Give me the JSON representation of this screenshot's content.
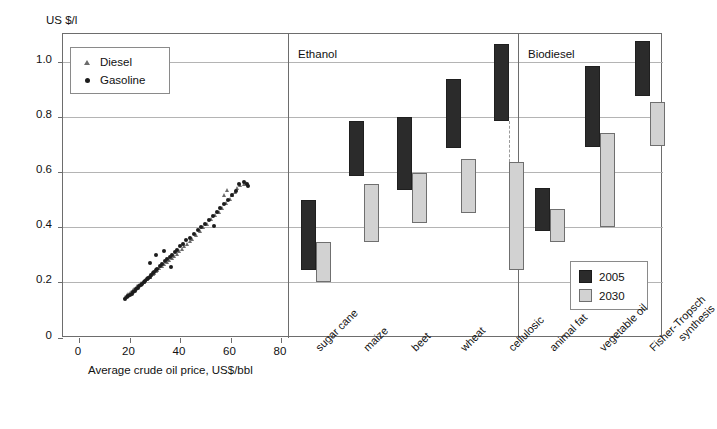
{
  "axes": {
    "y_axis_title": "US $/l",
    "y_ticks": [
      "0",
      "0.2",
      "0.4",
      "0.6",
      "0.8",
      "1.0"
    ],
    "x_axis_title_scatter": "Average crude oil price, US$/bbl",
    "x_ticks_scatter": [
      "0",
      "20",
      "40",
      "60",
      "80"
    ]
  },
  "legend_fuel": {
    "items": [
      {
        "label": "Diesel",
        "marker": "triangle-marker",
        "color": "#6b6b6b"
      },
      {
        "label": "Gasoline",
        "marker": "circle-marker",
        "color": "#1c1c1c"
      }
    ]
  },
  "legend_year": {
    "items": [
      {
        "label": "2005",
        "color": "#2b2b2b"
      },
      {
        "label": "2030",
        "color": "#d2d2d2"
      }
    ]
  },
  "panel_headers": [
    {
      "label": "Ethanol"
    },
    {
      "label": "Biodiesel"
    }
  ],
  "chart_data": [
    {
      "type": "scatter",
      "title": "",
      "xlabel": "Average crude oil price, US$/bbl",
      "ylabel": "US $/l",
      "xlim": [
        0,
        80
      ],
      "ylim": [
        0,
        1.1
      ],
      "grid": true,
      "legend_position": "top-left",
      "series": [
        {
          "name": "Diesel",
          "marker": "triangle",
          "color": "#6b6b6b",
          "points": [
            [
              18.6,
              0.145
            ],
            [
              19.2,
              0.15
            ],
            [
              19.8,
              0.155
            ],
            [
              20.4,
              0.158
            ],
            [
              21.0,
              0.163
            ],
            [
              21.6,
              0.168
            ],
            [
              22.2,
              0.172
            ],
            [
              22.8,
              0.178
            ],
            [
              23.4,
              0.182
            ],
            [
              24.0,
              0.188
            ],
            [
              24.6,
              0.193
            ],
            [
              25.2,
              0.196
            ],
            [
              25.8,
              0.2
            ],
            [
              26.4,
              0.205
            ],
            [
              27.0,
              0.21
            ],
            [
              27.6,
              0.213
            ],
            [
              28.2,
              0.218
            ],
            [
              28.8,
              0.222
            ],
            [
              29.4,
              0.228
            ],
            [
              30.0,
              0.232
            ],
            [
              30.6,
              0.238
            ],
            [
              31.2,
              0.243
            ],
            [
              32.0,
              0.248
            ],
            [
              33.0,
              0.255
            ],
            [
              34.0,
              0.262
            ],
            [
              35.0,
              0.27
            ],
            [
              36.0,
              0.278
            ],
            [
              37.0,
              0.285
            ],
            [
              38.0,
              0.292
            ],
            [
              39.0,
              0.3
            ],
            [
              40.0,
              0.31
            ],
            [
              41.0,
              0.318
            ],
            [
              42.0,
              0.328
            ],
            [
              43.0,
              0.336
            ],
            [
              44.0,
              0.345
            ],
            [
              45.0,
              0.353
            ],
            [
              46.5,
              0.368
            ],
            [
              48.0,
              0.382
            ],
            [
              49.5,
              0.398
            ],
            [
              51.0,
              0.41
            ],
            [
              52.5,
              0.425
            ],
            [
              54.0,
              0.44
            ],
            [
              55.5,
              0.452
            ],
            [
              57.0,
              0.468
            ],
            [
              58.5,
              0.485
            ],
            [
              60.0,
              0.5
            ],
            [
              61.0,
              0.512
            ],
            [
              62.0,
              0.525
            ],
            [
              63.0,
              0.54
            ],
            [
              64.0,
              0.548
            ],
            [
              65.5,
              0.553
            ],
            [
              66.5,
              0.558
            ],
            [
              59.0,
              0.532
            ],
            [
              57.5,
              0.515
            ]
          ]
        },
        {
          "name": "Gasoline",
          "marker": "circle",
          "color": "#1c1c1c",
          "points": [
            [
              18.4,
              0.14
            ],
            [
              19.0,
              0.146
            ],
            [
              19.6,
              0.15
            ],
            [
              20.2,
              0.154
            ],
            [
              20.8,
              0.159
            ],
            [
              21.4,
              0.164
            ],
            [
              22.0,
              0.17
            ],
            [
              22.6,
              0.175
            ],
            [
              23.2,
              0.18
            ],
            [
              23.8,
              0.186
            ],
            [
              24.4,
              0.19
            ],
            [
              25.0,
              0.195
            ],
            [
              25.6,
              0.2
            ],
            [
              26.2,
              0.206
            ],
            [
              26.8,
              0.212
            ],
            [
              27.4,
              0.216
            ],
            [
              28.0,
              0.22
            ],
            [
              28.6,
              0.226
            ],
            [
              29.2,
              0.232
            ],
            [
              29.8,
              0.238
            ],
            [
              30.4,
              0.244
            ],
            [
              31.0,
              0.25
            ],
            [
              32.0,
              0.26
            ],
            [
              33.0,
              0.268
            ],
            [
              34.0,
              0.276
            ],
            [
              35.0,
              0.285
            ],
            [
              36.0,
              0.292
            ],
            [
              37.0,
              0.3
            ],
            [
              38.0,
              0.31
            ],
            [
              39.0,
              0.318
            ],
            [
              40.0,
              0.33
            ],
            [
              41.0,
              0.34
            ],
            [
              42.5,
              0.352
            ],
            [
              44.0,
              0.362
            ],
            [
              45.5,
              0.375
            ],
            [
              47.0,
              0.388
            ],
            [
              48.5,
              0.4
            ],
            [
              50.0,
              0.412
            ],
            [
              51.5,
              0.425
            ],
            [
              53.0,
              0.44
            ],
            [
              54.5,
              0.455
            ],
            [
              56.0,
              0.468
            ],
            [
              57.5,
              0.482
            ],
            [
              59.0,
              0.5
            ],
            [
              60.5,
              0.515
            ],
            [
              62.0,
              0.53
            ],
            [
              63.5,
              0.555
            ],
            [
              65.5,
              0.565
            ],
            [
              66.5,
              0.555
            ],
            [
              66.8,
              0.548
            ],
            [
              30.5,
              0.3
            ],
            [
              33.5,
              0.315
            ],
            [
              28.0,
              0.27
            ],
            [
              36.5,
              0.255
            ],
            [
              53.5,
              0.405
            ]
          ]
        }
      ]
    },
    {
      "type": "range-bar",
      "title": "Ethanol",
      "ylabel": "US $/l",
      "ylim": [
        0,
        1.1
      ],
      "grid": true,
      "categories": [
        "sugar cane",
        "maize",
        "beet",
        "wheat",
        "cellulosic"
      ],
      "series": [
        {
          "name": "2005",
          "color": "#2b2b2b",
          "ranges": [
            [
              0.245,
              0.5
            ],
            [
              0.585,
              0.785
            ],
            [
              0.535,
              0.8
            ],
            [
              0.685,
              0.935
            ],
            [
              0.785,
              1.065
            ]
          ]
        },
        {
          "name": "2030",
          "color": "#d2d2d2",
          "ranges": [
            [
              0.2,
              0.345
            ],
            [
              0.345,
              0.555
            ],
            [
              0.415,
              0.595
            ],
            [
              0.45,
              0.645
            ],
            [
              0.245,
              0.635
            ]
          ]
        }
      ],
      "connector_dashed": [
        "cellulosic"
      ]
    },
    {
      "type": "range-bar",
      "title": "Biodiesel",
      "ylabel": "US $/l",
      "ylim": [
        0,
        1.1
      ],
      "grid": true,
      "categories": [
        "animal fat",
        "vegetable oil",
        "Fisher-Tropsch synthesis"
      ],
      "series": [
        {
          "name": "2005",
          "color": "#2b2b2b",
          "ranges": [
            [
              0.385,
              0.54
            ],
            [
              0.69,
              0.985
            ],
            [
              0.875,
              1.075
            ]
          ]
        },
        {
          "name": "2030",
          "color": "#d2d2d2",
          "ranges": [
            [
              0.345,
              0.465
            ],
            [
              0.4,
              0.74
            ],
            [
              0.695,
              0.855
            ]
          ]
        }
      ],
      "connector_dashed": []
    }
  ]
}
